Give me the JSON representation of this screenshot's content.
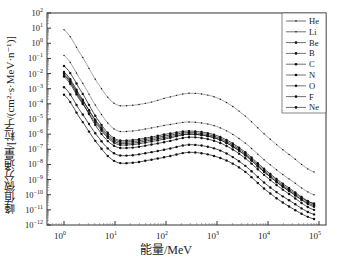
{
  "chart_data": {
    "type": "line",
    "title": "",
    "xlabel": "能量/MeV",
    "ylabel": "峰值微分通量/[粒子/(cm²·s·MeV·n⁻¹)]",
    "xscale": "log",
    "yscale": "log",
    "xlim": [
      0.6,
      100000
    ],
    "ylim": [
      1e-12,
      100
    ],
    "x_ticks": [
      "10^0",
      "10^1",
      "10^2",
      "10^3",
      "10^4",
      "10^5"
    ],
    "y_ticks": [
      "10^2",
      "10^1",
      "10^0",
      "10^-1",
      "10^-2",
      "10^-3",
      "10^-4",
      "10^-5",
      "10^-6",
      "10^-7",
      "10^-8",
      "10^-9",
      "10^-10",
      "10^-11",
      "10^-12"
    ],
    "legend_position": "upper right",
    "grid": false,
    "x": [
      1,
      2,
      5,
      10,
      20,
      50,
      100,
      300,
      1000,
      3000,
      10000,
      30000,
      80000
    ],
    "series_log10": [
      {
        "name": "He",
        "marker": "small-dot",
        "values": [
          0.9,
          -0.6,
          -2.8,
          -4.0,
          -4.1,
          -3.9,
          -3.6,
          -3.3,
          -3.6,
          -4.6,
          -6.2,
          -7.5,
          -8.5
        ]
      },
      {
        "name": "Li",
        "marker": "small-dot",
        "values": [
          -0.8,
          -2.3,
          -4.5,
          -5.7,
          -5.8,
          -5.6,
          -5.4,
          -5.2,
          -5.5,
          -6.4,
          -7.9,
          -9.1,
          -10.0
        ]
      },
      {
        "name": "Be",
        "marker": "dot",
        "values": [
          -1.5,
          -3.0,
          -5.2,
          -6.3,
          -6.4,
          -6.2,
          -6.0,
          -5.8,
          -6.1,
          -7.0,
          -8.5,
          -9.7,
          -10.6
        ]
      },
      {
        "name": "B",
        "marker": "dot",
        "values": [
          -1.9,
          -3.4,
          -5.5,
          -6.5,
          -6.6,
          -6.4,
          -6.2,
          -6.0,
          -6.3,
          -7.2,
          -8.7,
          -9.9,
          -10.7
        ]
      },
      {
        "name": "C",
        "marker": "dot",
        "values": [
          -2.0,
          -3.5,
          -5.4,
          -6.4,
          -6.5,
          -6.3,
          -6.1,
          -5.9,
          -6.2,
          -7.1,
          -8.6,
          -9.8,
          -10.6
        ]
      },
      {
        "name": "N",
        "marker": "dot",
        "values": [
          -2.1,
          -3.6,
          -5.8,
          -6.8,
          -6.9,
          -6.7,
          -6.5,
          -6.2,
          -6.5,
          -7.4,
          -8.9,
          -10.1,
          -11.0
        ]
      },
      {
        "name": "O",
        "marker": "dot",
        "values": [
          -2.2,
          -3.7,
          -5.6,
          -6.6,
          -6.7,
          -6.5,
          -6.3,
          -6.0,
          -6.3,
          -7.2,
          -8.7,
          -9.9,
          -10.8
        ]
      },
      {
        "name": "F",
        "marker": "dot",
        "values": [
          -2.9,
          -4.4,
          -6.3,
          -7.3,
          -7.4,
          -7.2,
          -7.0,
          -6.7,
          -7.0,
          -7.9,
          -9.4,
          -10.5,
          -11.3
        ]
      },
      {
        "name": "Ne",
        "marker": "dot",
        "values": [
          -3.4,
          -4.9,
          -6.8,
          -7.8,
          -7.9,
          -7.7,
          -7.5,
          -7.2,
          -7.5,
          -8.3,
          -9.8,
          -10.9,
          -11.6
        ]
      }
    ]
  },
  "labels": {
    "ylabel": "峰值微分通量/[粒子/(cm²·s·MeV·n⁻¹)]",
    "xlabel": "能量/MeV"
  }
}
